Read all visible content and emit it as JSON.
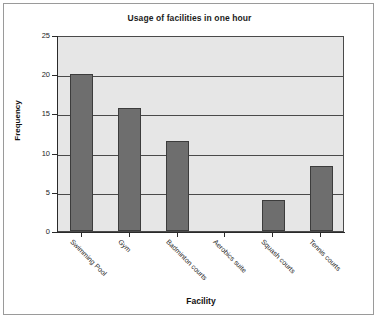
{
  "chart_data": {
    "type": "bar",
    "title": "Usage of facilities in one hour",
    "xlabel": "Facility",
    "ylabel": "Frequency",
    "categories": [
      "Swimming Pool",
      "Gym",
      "Badminton courts",
      "Aerobics suite",
      "Squash courts",
      "Tennis courts"
    ],
    "values": [
      20,
      15.7,
      11.5,
      0,
      4,
      8.3
    ],
    "ylim": [
      0,
      25
    ],
    "yticks": [
      0,
      5,
      10,
      15,
      20,
      25
    ],
    "ytick_labels": [
      "0",
      "5",
      "10",
      "15",
      "20",
      "25"
    ],
    "grid": "horizontal",
    "legend": "none",
    "colors": {
      "bar_fill": "#6e6e6e",
      "bar_edge": "#3c3c3c",
      "plot_background": "#e6e6e6",
      "gridline": "#4a4a4a",
      "axis": "#2a2a2a",
      "text": "#1c1c1c",
      "frame_border": "#9a9a9a",
      "page_background": "#ffffff"
    }
  }
}
